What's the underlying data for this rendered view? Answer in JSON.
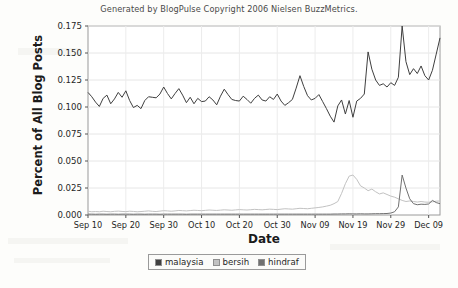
{
  "credit": "Generated by BlogPulse Copyright 2006 Nielsen BuzzMetrics.",
  "legend": {
    "items": [
      {
        "label": "malaysia",
        "color": "#3f3f3f"
      },
      {
        "label": "bersih",
        "color": "#c2c2c2"
      },
      {
        "label": "hindraf",
        "color": "#707070"
      }
    ]
  },
  "chart_data": {
    "type": "line",
    "title": "Generated by BlogPulse Copyright 2006 Nielsen BuzzMetrics.",
    "xlabel": "Date",
    "ylabel": "Percent of All Blog Posts",
    "ylim": [
      0.0,
      0.175
    ],
    "yticks": [
      0.0,
      0.025,
      0.05,
      0.075,
      0.1,
      0.125,
      0.15,
      0.175
    ],
    "ytick_labels": [
      "0.000",
      "0.025",
      "0.050",
      "0.075",
      "0.100",
      "0.125",
      "0.150",
      "0.175"
    ],
    "xticks": [
      0,
      10,
      20,
      30,
      40,
      50,
      60,
      70,
      80,
      90
    ],
    "xtick_labels": [
      "Sep 10",
      "Sep 20",
      "Sep 30",
      "Oct 10",
      "Oct 20",
      "Oct 30",
      "Nov 09",
      "Nov 19",
      "Nov 29",
      "Dec 09"
    ],
    "x_start": "Sep 10",
    "x_end": "Dec 13",
    "n_points": 94,
    "grid": true,
    "legend_position": "bottom-center",
    "series": [
      {
        "name": "malaysia",
        "color": "#3f3f3f",
        "values": [
          0.1135,
          0.1095,
          0.1045,
          0.1005,
          0.108,
          0.111,
          0.103,
          0.1075,
          0.1135,
          0.109,
          0.115,
          0.106,
          0.0995,
          0.1015,
          0.0985,
          0.106,
          0.1095,
          0.109,
          0.1085,
          0.112,
          0.1185,
          0.1125,
          0.1075,
          0.1125,
          0.117,
          0.111,
          0.104,
          0.109,
          0.103,
          0.108,
          0.105,
          0.1055,
          0.1095,
          0.1065,
          0.102,
          0.11,
          0.1165,
          0.1115,
          0.107,
          0.106,
          0.1055,
          0.11,
          0.107,
          0.1035,
          0.108,
          0.111,
          0.1065,
          0.1055,
          0.1095,
          0.107,
          0.112,
          0.1055,
          0.1015,
          0.104,
          0.107,
          0.1175,
          0.129,
          0.119,
          0.1105,
          0.1065,
          0.108,
          0.1115,
          0.105,
          0.0985,
          0.0915,
          0.086,
          0.101,
          0.1065,
          0.0935,
          0.106,
          0.0905,
          0.1055,
          0.108,
          0.112,
          0.151,
          0.135,
          0.125,
          0.12,
          0.1215,
          0.1185,
          0.1225,
          0.12,
          0.1275,
          0.175,
          0.142,
          0.13,
          0.1355,
          0.131,
          0.138,
          0.129,
          0.125,
          0.134,
          0.149,
          0.164
        ]
      },
      {
        "name": "bersih",
        "color": "#c2c2c2",
        "values": [
          0.0035,
          0.003,
          0.0032,
          0.003,
          0.0035,
          0.0032,
          0.003,
          0.0034,
          0.0036,
          0.0033,
          0.0031,
          0.0035,
          0.0033,
          0.003,
          0.0032,
          0.0035,
          0.0038,
          0.0034,
          0.0032,
          0.0036,
          0.004,
          0.0038,
          0.0035,
          0.0038,
          0.0042,
          0.004,
          0.0038,
          0.0041,
          0.0044,
          0.0042,
          0.004,
          0.0043,
          0.0046,
          0.0044,
          0.0042,
          0.0045,
          0.0048,
          0.0046,
          0.0044,
          0.0047,
          0.005,
          0.0048,
          0.0046,
          0.0049,
          0.0052,
          0.005,
          0.0048,
          0.0051,
          0.0054,
          0.0052,
          0.005,
          0.0054,
          0.0058,
          0.0056,
          0.0054,
          0.0058,
          0.0062,
          0.006,
          0.0058,
          0.0062,
          0.0066,
          0.007,
          0.0075,
          0.0082,
          0.009,
          0.0105,
          0.0125,
          0.02,
          0.029,
          0.036,
          0.037,
          0.033,
          0.027,
          0.025,
          0.0225,
          0.024,
          0.0215,
          0.0195,
          0.0205,
          0.019,
          0.0175,
          0.0165,
          0.015,
          0.0135,
          0.0125,
          0.013,
          0.0125,
          0.012,
          0.0125,
          0.012,
          0.0118,
          0.0122,
          0.0128,
          0.013
        ]
      },
      {
        "name": "hindraf",
        "color": "#707070",
        "values": [
          0.0008,
          0.0008,
          0.0007,
          0.0008,
          0.0008,
          0.0007,
          0.0008,
          0.0008,
          0.0007,
          0.0008,
          0.0008,
          0.0008,
          0.0007,
          0.0008,
          0.0008,
          0.0007,
          0.0008,
          0.0008,
          0.0008,
          0.0007,
          0.0008,
          0.0008,
          0.0008,
          0.0008,
          0.0008,
          0.0008,
          0.0007,
          0.0008,
          0.0008,
          0.0008,
          0.0008,
          0.0008,
          0.0008,
          0.0008,
          0.0008,
          0.0008,
          0.0008,
          0.0008,
          0.0008,
          0.0008,
          0.0008,
          0.0008,
          0.0008,
          0.0008,
          0.0008,
          0.0008,
          0.0008,
          0.0008,
          0.0008,
          0.0008,
          0.0008,
          0.0008,
          0.0008,
          0.0008,
          0.0008,
          0.0008,
          0.0008,
          0.0008,
          0.0008,
          0.0008,
          0.0008,
          0.0008,
          0.0008,
          0.0008,
          0.0008,
          0.0009,
          0.0009,
          0.001,
          0.001,
          0.0011,
          0.001,
          0.001,
          0.0011,
          0.001,
          0.001,
          0.0011,
          0.0012,
          0.0012,
          0.0013,
          0.0014,
          0.0018,
          0.003,
          0.0075,
          0.037,
          0.025,
          0.015,
          0.0105,
          0.0095,
          0.01,
          0.0098,
          0.0102,
          0.0135,
          0.0115,
          0.0105
        ]
      }
    ]
  }
}
